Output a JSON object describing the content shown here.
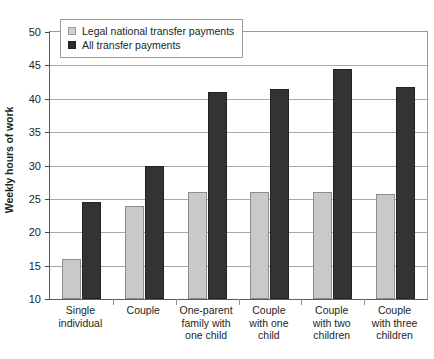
{
  "chart_data": {
    "type": "bar",
    "title": "",
    "xlabel": "",
    "ylabel": "Weekly hours of work",
    "ylim": [
      10,
      50
    ],
    "ytick_step": 5,
    "yticks": [
      10,
      15,
      20,
      25,
      30,
      35,
      40,
      45,
      50
    ],
    "ytick_labels": [
      "10",
      "15",
      "20",
      "25",
      "30",
      "35",
      "40",
      "45",
      "50"
    ],
    "grid": true,
    "legend_position": "top-left",
    "categories": [
      "Single individual",
      "Couple",
      "One-parent family with one child",
      "Couple with one child",
      "Couple with two children",
      "Couple with three children"
    ],
    "category_label_lines": [
      [
        "Single",
        "individual"
      ],
      [
        "Couple"
      ],
      [
        "One-parent",
        "family with",
        "one child"
      ],
      [
        "Couple",
        "with one",
        "child"
      ],
      [
        "Couple",
        "with two",
        "children"
      ],
      [
        "Couple",
        "with three",
        "children"
      ]
    ],
    "series": [
      {
        "name": "Legal national transfer payments",
        "color": "#c9c9c9",
        "values": [
          16,
          24,
          26,
          26,
          26,
          25.8
        ]
      },
      {
        "name": "All transfer payments",
        "color": "#333234",
        "values": [
          24.5,
          30,
          41,
          41.4,
          44.4,
          41.8
        ]
      }
    ]
  },
  "legend": {
    "items": [
      {
        "label": "Legal national transfer payments",
        "swatch": "light"
      },
      {
        "label": "All transfer payments",
        "swatch": "dark"
      }
    ]
  },
  "axis": {
    "y_title": "Weekly hours of work"
  }
}
